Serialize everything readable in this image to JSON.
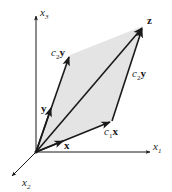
{
  "diagram": {
    "colors": {
      "plane_fill": "#e4e4e4",
      "stroke": "#1a1a1a",
      "background": "#ffffff"
    },
    "axes": {
      "x1": {
        "base": "x",
        "sub": "1"
      },
      "x2": {
        "base": "x",
        "sub": "2"
      },
      "x3": {
        "base": "x",
        "sub": "3"
      }
    },
    "vectors": {
      "x": {
        "label": "x"
      },
      "y": {
        "label": "y"
      },
      "c1x": {
        "coef": "c",
        "coef_sub": "1",
        "vec": "x"
      },
      "c2y_left": {
        "coef": "c",
        "coef_sub": "2",
        "vec": "y"
      },
      "c2y_right": {
        "coef": "c",
        "coef_sub": "2",
        "vec": "y"
      },
      "z": {
        "label": "z"
      }
    }
  }
}
